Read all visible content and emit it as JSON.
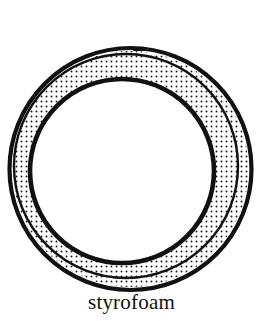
{
  "figure": {
    "kind": "technical-line-drawing",
    "caption": "styrofoam",
    "background_color": "#ffffff",
    "ink_color": "#111111",
    "stipple_color": "#1a1a1a"
  },
  "caption": {
    "label": "styrofoam"
  },
  "geometry": {
    "outer_circle": {
      "name": "outer-boundary",
      "cx": 130.5,
      "cy": 169.0,
      "r": 121.0,
      "stroke_width": 4.2
    },
    "gap_arc": {
      "name": "inner-wall-secondary-arc",
      "cx": 126.0,
      "cy": 166.0,
      "r": 112.0,
      "stroke_width": 2.4
    },
    "stipple_outer_edge": {
      "name": "stipple-band-outer-edge",
      "cx": 130.5,
      "cy": 169.0,
      "r": 118.0
    },
    "inner_circle": {
      "name": "inner-boundary",
      "cx": 122.0,
      "cy": 171.0,
      "r": 92.0,
      "stroke_width": 4.6
    },
    "stipple": {
      "dot_radius": 0.95,
      "spacing": 5.0,
      "offset_x": 1.5,
      "offset_y": 1.5
    },
    "seam_mark": {
      "name": "top-seam-break",
      "x": 133,
      "y": 48,
      "width": 12,
      "height": 3
    }
  },
  "colors": {
    "ink": "#111111",
    "paper": "#ffffff",
    "stipple": "#1a1a1a"
  }
}
